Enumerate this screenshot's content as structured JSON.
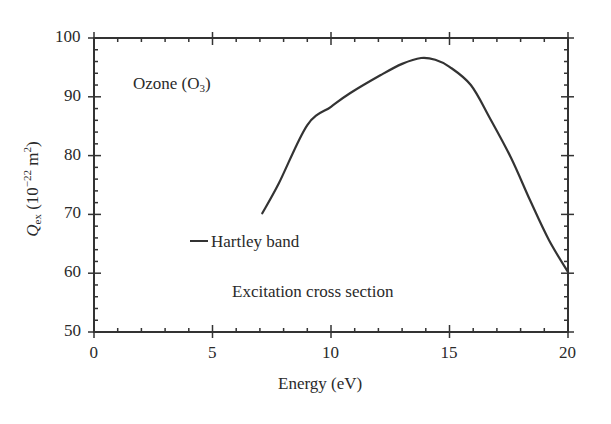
{
  "chart_data": {
    "type": "line",
    "title": "",
    "xlabel": "Energy (eV)",
    "ylabel": "Q_ex (10^-22 m^2)",
    "ylabel_parts": {
      "sym": "Q",
      "sub": "ex",
      "pre": " (10",
      "exp": "−22",
      "mid": " m",
      "exp2": "2",
      "post": ")"
    },
    "xlim": [
      0,
      20
    ],
    "ylim": [
      50,
      100
    ],
    "xticks": [
      0,
      5,
      10,
      15,
      20
    ],
    "yticks": [
      50,
      60,
      70,
      80,
      90,
      100
    ],
    "xminor_step": 1,
    "yminor_step": 2,
    "grid": false,
    "annotations": {
      "molecule": {
        "text": "Ozone (O",
        "sub": "3",
        "close": ")"
      },
      "legend": "Hartley band",
      "caption": "Excitation cross section"
    },
    "series": [
      {
        "name": "Hartley band",
        "color": "#333333",
        "x": [
          7.1,
          7.8,
          9.0,
          10.0,
          10.8,
          12.1,
          13.0,
          13.8,
          14.4,
          15.0,
          15.9,
          16.7,
          17.6,
          18.4,
          19.2,
          20.0
        ],
        "y": [
          70.2,
          75.3,
          85.2,
          88.3,
          90.6,
          93.7,
          95.6,
          96.6,
          96.3,
          95.1,
          92.0,
          86.4,
          79.6,
          72.4,
          65.6,
          60.2
        ]
      }
    ]
  }
}
